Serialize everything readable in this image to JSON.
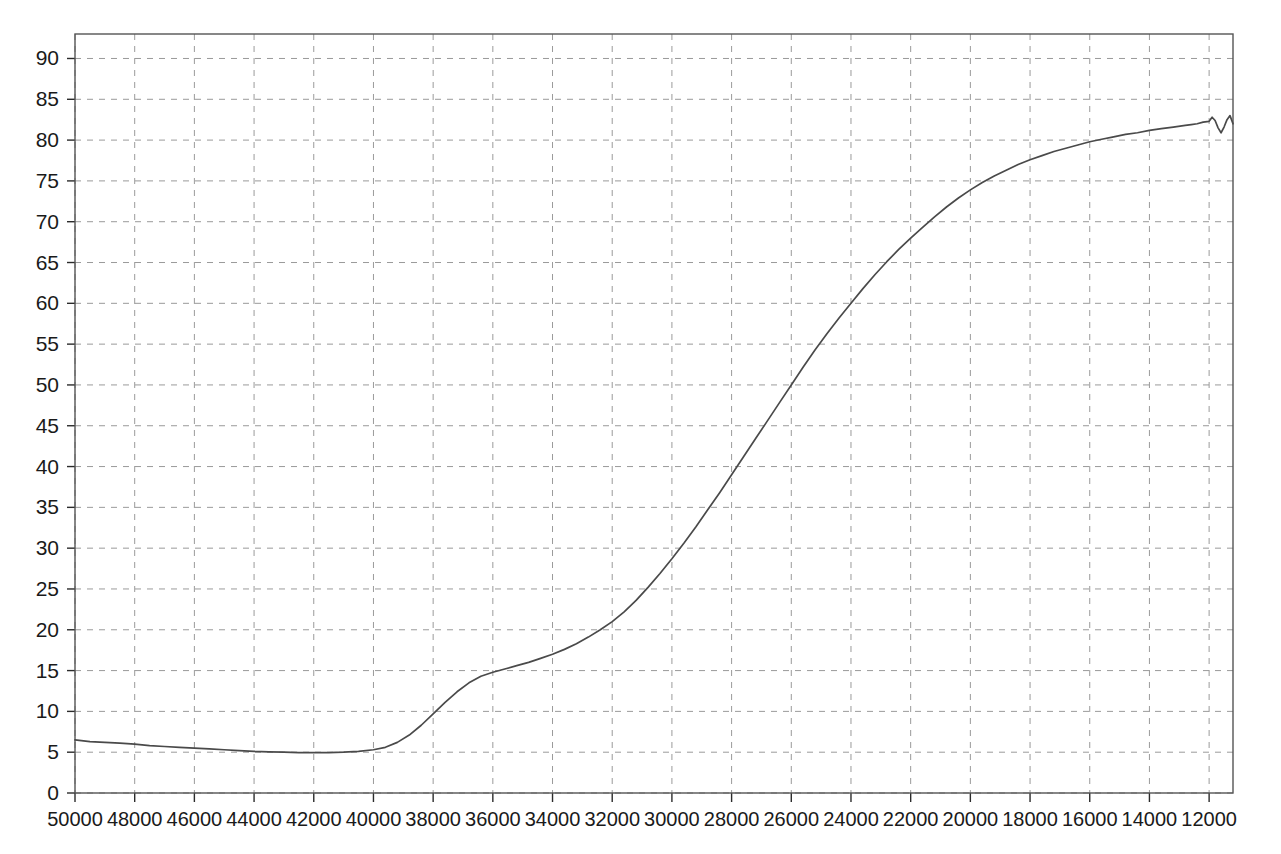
{
  "chart_data": {
    "type": "line",
    "title": "",
    "subtitle": "",
    "xlabel": "",
    "ylabel": "",
    "xlim": [
      50000,
      11200
    ],
    "ylim": [
      0,
      93
    ],
    "x_axis_reversed": true,
    "grid": true,
    "grid_style": "dashed",
    "legend": null,
    "legend_position": "none",
    "annotations": [],
    "series_color": "#4a4a4a",
    "background_color": "#ffffff",
    "grid_color": "#9a9a9a",
    "frame_color": "#555555",
    "y_ticks": [
      0,
      5,
      10,
      15,
      20,
      25,
      30,
      35,
      40,
      45,
      50,
      55,
      60,
      65,
      70,
      75,
      80,
      85,
      90
    ],
    "y_tick_labels": [
      "0",
      "5",
      "10",
      "15",
      "20",
      "25",
      "30",
      "35",
      "40",
      "45",
      "50",
      "55",
      "60",
      "65",
      "70",
      "75",
      "80",
      "85",
      "90"
    ],
    "x_ticks": [
      50000,
      48000,
      46000,
      44000,
      42000,
      40000,
      38000,
      36000,
      34000,
      32000,
      30000,
      28000,
      26000,
      24000,
      22000,
      20000,
      18000,
      16000,
      14000,
      12000
    ],
    "x_tick_labels": [
      "50000",
      "48000",
      "46000",
      "44000",
      "42000",
      "40000",
      "38000",
      "36000",
      "34000",
      "32000",
      "30000",
      "28000",
      "26000",
      "24000",
      "22000",
      "20000",
      "18000",
      "16000",
      "14000",
      "12000"
    ],
    "series": [
      {
        "name": "transmittance",
        "x": [
          50000,
          49500,
          49000,
          48500,
          48000,
          47500,
          47000,
          46500,
          46000,
          45500,
          45000,
          44500,
          44000,
          43500,
          43000,
          42500,
          42000,
          41500,
          41000,
          40500,
          40000,
          39600,
          39200,
          38800,
          38400,
          38000,
          37600,
          37200,
          36800,
          36400,
          36000,
          35600,
          35200,
          34800,
          34400,
          34000,
          33600,
          33200,
          32800,
          32400,
          32000,
          31600,
          31200,
          30800,
          30400,
          30000,
          29600,
          29200,
          28800,
          28400,
          28000,
          27600,
          27200,
          26800,
          26400,
          26000,
          25600,
          25200,
          24800,
          24400,
          24000,
          23600,
          23200,
          22800,
          22400,
          22000,
          21600,
          21200,
          20800,
          20400,
          20000,
          19600,
          19200,
          18800,
          18400,
          18000,
          17600,
          17200,
          16800,
          16400,
          16000,
          15600,
          15200,
          14800,
          14400,
          14000,
          13600,
          13200,
          12800,
          12600,
          12400,
          12200,
          12000,
          11900,
          11800,
          11700,
          11600,
          11500,
          11400,
          11300,
          11200
        ],
        "y": [
          6.5,
          6.3,
          6.2,
          6.1,
          6.0,
          5.8,
          5.7,
          5.6,
          5.5,
          5.4,
          5.3,
          5.2,
          5.1,
          5.05,
          5.0,
          4.95,
          4.95,
          4.95,
          5.0,
          5.1,
          5.3,
          5.6,
          6.2,
          7.1,
          8.3,
          9.7,
          11.1,
          12.4,
          13.5,
          14.3,
          14.8,
          15.2,
          15.6,
          16.0,
          16.5,
          17.0,
          17.6,
          18.3,
          19.1,
          20.0,
          21.0,
          22.2,
          23.6,
          25.2,
          26.9,
          28.7,
          30.6,
          32.6,
          34.7,
          36.8,
          39.0,
          41.2,
          43.4,
          45.6,
          47.8,
          50.0,
          52.2,
          54.3,
          56.3,
          58.2,
          60.0,
          61.8,
          63.5,
          65.1,
          66.6,
          68.0,
          69.3,
          70.6,
          71.8,
          72.9,
          73.9,
          74.8,
          75.6,
          76.3,
          77.0,
          77.6,
          78.1,
          78.6,
          79.0,
          79.4,
          79.8,
          80.1,
          80.4,
          80.7,
          80.9,
          81.2,
          81.4,
          81.6,
          81.8,
          81.9,
          82.0,
          82.2,
          82.3,
          82.8,
          82.4,
          81.5,
          80.9,
          81.6,
          82.5,
          83.0,
          82.0
        ]
      }
    ],
    "key_points": [
      {
        "x": 50000,
        "y": 6.5,
        "note": "start"
      },
      {
        "x": 42500,
        "y": 5.0,
        "note": "minimum"
      },
      {
        "x": 39500,
        "y": 6.4,
        "note": "rise begins"
      },
      {
        "x": 38000,
        "y": 9.7,
        "note": "passes 10"
      },
      {
        "x": 36400,
        "y": 14.3,
        "note": "near 15"
      },
      {
        "x": 33000,
        "y": 18.8,
        "note": "shoulder"
      },
      {
        "x": 30000,
        "y": 28.7,
        "note": "steep rise"
      },
      {
        "x": 26000,
        "y": 50.0,
        "note": "midpoint"
      },
      {
        "x": 24000,
        "y": 60.0,
        "note": ""
      },
      {
        "x": 22000,
        "y": 68.0,
        "note": ""
      },
      {
        "x": 20000,
        "y": 73.9,
        "note": ""
      },
      {
        "x": 18000,
        "y": 77.6,
        "note": ""
      },
      {
        "x": 16000,
        "y": 79.8,
        "note": ""
      },
      {
        "x": 14000,
        "y": 81.2,
        "note": ""
      },
      {
        "x": 12000,
        "y": 82.3,
        "note": "plateau"
      },
      {
        "x": 11500,
        "y": 81.6,
        "note": "end wobble"
      }
    ]
  }
}
